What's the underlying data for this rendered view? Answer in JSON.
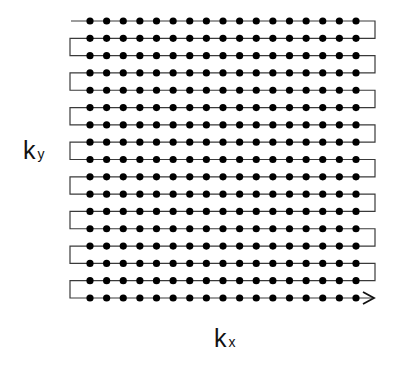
{
  "diagram": {
    "type": "k-space-raster-scan",
    "grid": {
      "rows": 17,
      "points_per_row": 17,
      "row_y_start": 21,
      "row_y_end": 298,
      "point_x_start": 90,
      "point_x_end": 356,
      "left_turn_x": 70,
      "right_turn_x": 375,
      "start_x": 71,
      "arrow_tip_x": 374,
      "point_radius": 3.6
    },
    "colors": {
      "line": "#3a3a3a",
      "point": "#000000",
      "background": "#ffffff"
    },
    "labels": {
      "ky_main": "k",
      "ky_sub": "y",
      "kx_main": "k",
      "kx_sub": "x"
    },
    "icons": {
      "arrow": "arrowhead-right-icon"
    }
  }
}
